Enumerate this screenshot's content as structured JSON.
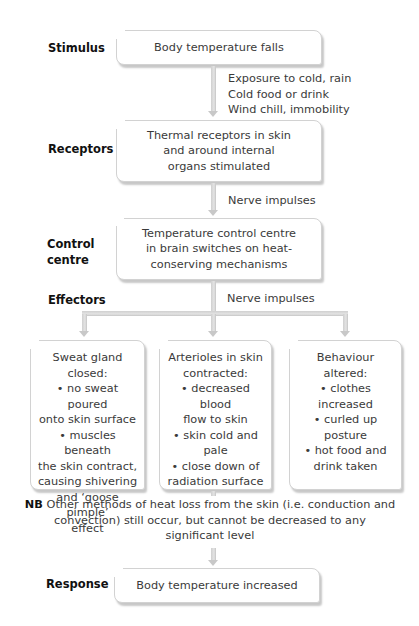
{
  "diagram": {
    "stages": {
      "stimulus": {
        "label": "Stimulus",
        "text": [
          "Body temperature falls"
        ]
      },
      "receptors": {
        "label": "Receptors",
        "text": [
          "Thermal receptors in skin",
          "and around internal",
          "organs stimulated"
        ]
      },
      "control": {
        "label_lines": [
          "Control",
          "centre"
        ],
        "text": [
          "Temperature control centre",
          "in brain switches on heat-",
          "conserving mechanisms"
        ]
      },
      "effectors": {
        "label": "Effectors"
      },
      "response": {
        "label": "Response",
        "text": [
          "Body temperature increased"
        ]
      }
    },
    "connector_notes": {
      "stimulus_to_receptors": [
        "Exposure to cold, rain",
        "Cold food or drink",
        "Wind chill, immobility"
      ],
      "receptors_to_control": [
        "Nerve impulses"
      ],
      "control_to_effectors": [
        "Nerve impulses"
      ]
    },
    "effector_boxes": [
      {
        "lines": [
          "Sweat gland",
          "closed:",
          "• no sweat poured",
          "onto skin surface",
          "• muscles beneath",
          "the skin contract,",
          "causing shivering",
          "and ‘goose pimple’",
          "effect"
        ]
      },
      {
        "lines": [
          "Arterioles in skin",
          "contracted:",
          "• decreased blood",
          "flow to skin",
          "• skin cold and",
          "pale",
          "• close down of",
          "radiation surface"
        ]
      },
      {
        "lines": [
          "Behaviour altered:",
          "• clothes",
          "increased",
          "• curled up",
          "posture",
          "• hot food and",
          "drink taken"
        ]
      }
    ],
    "note": {
      "prefix": "NB",
      "lines": [
        "Other methods of heat loss from the skin (i.e. conduction and",
        "convection) still occur, but cannot be decreased to any",
        "significant level"
      ]
    },
    "colors": {
      "connector": "#cfcfcf",
      "box_border": "#d2d2d2",
      "label": "#111111",
      "text": "#3a3a3a"
    }
  }
}
